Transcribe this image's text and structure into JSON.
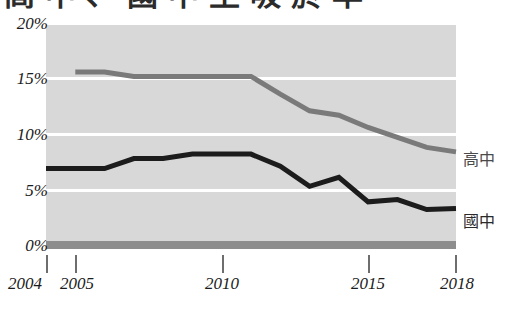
{
  "title": "高中、國中生吸菸率",
  "chart_data": {
    "type": "line",
    "title": "高中、國中生吸菸率",
    "xlabel": "",
    "ylabel": "",
    "grid": true,
    "legend_position": "right-inline",
    "xlim": [
      2004,
      2018
    ],
    "ylim": [
      0,
      20
    ],
    "x_ticks": [
      "2004",
      "2005",
      "2010",
      "2015",
      "2018"
    ],
    "x_tick_values": [
      2004,
      2005,
      2010,
      2015,
      2018
    ],
    "y_ticks": [
      "0%",
      "5%",
      "10%",
      "15%",
      "20%"
    ],
    "y_tick_values": [
      0,
      5,
      10,
      15,
      20
    ],
    "x": [
      2004,
      2005,
      2006,
      2007,
      2008,
      2009,
      2010,
      2011,
      2012,
      2013,
      2014,
      2015,
      2016,
      2017,
      2018
    ],
    "series": [
      {
        "name": "高中",
        "color": "#7a7a7a",
        "values": [
          null,
          15.5,
          15.5,
          15.1,
          15.1,
          15.1,
          15.1,
          15.1,
          13.5,
          12.0,
          11.6,
          10.5,
          9.6,
          8.7,
          8.3
        ]
      },
      {
        "name": "國中",
        "color": "#1c1c1c",
        "values": [
          6.8,
          6.8,
          6.8,
          7.7,
          7.7,
          8.1,
          8.1,
          8.1,
          7.0,
          5.2,
          6.0,
          3.8,
          4.0,
          3.1,
          3.2
        ]
      }
    ]
  },
  "y_axis": {
    "labels": [
      {
        "text": "20%",
        "value": 20
      },
      {
        "text": "15%",
        "value": 15
      },
      {
        "text": "10%",
        "value": 10
      },
      {
        "text": "5%",
        "value": 5
      },
      {
        "text": "0%",
        "value": 0
      }
    ]
  },
  "x_axis": {
    "labels": [
      {
        "text": "2004",
        "value": 2004
      },
      {
        "text": "2005",
        "value": 2005
      },
      {
        "text": "2010",
        "value": 2010
      },
      {
        "text": "2015",
        "value": 2015
      },
      {
        "text": "2018",
        "value": 2018
      }
    ]
  },
  "legend": {
    "items": [
      {
        "label": "高中",
        "color": "#7a7a7a"
      },
      {
        "label": "國中",
        "color": "#1c1c1c"
      }
    ]
  },
  "colors": {
    "plot_background": "#d8d8d8",
    "gridline": "#ffffff",
    "baseline": "#8d8d8d",
    "series_high_school": "#7a7a7a",
    "series_junior_high": "#1c1c1c",
    "axis_text": "#1b1b1b"
  }
}
